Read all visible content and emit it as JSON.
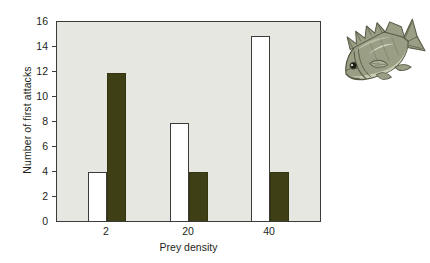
{
  "chart_data": {
    "type": "bar",
    "title": "",
    "xlabel": "Prey density",
    "ylabel": "Number of first attacks",
    "categories": [
      "2",
      "20",
      "40"
    ],
    "ylim": [
      0,
      16
    ],
    "yticks": [
      0,
      2,
      4,
      6,
      8,
      10,
      12,
      14,
      16
    ],
    "ytick_labels": [
      "0",
      "2",
      "4",
      "6",
      "8",
      "10",
      "12",
      "14",
      "16"
    ],
    "grid": false,
    "legend": "none",
    "series": [
      {
        "name": "open",
        "fill": "#ffffff",
        "values": [
          4,
          8,
          15
        ]
      },
      {
        "name": "filled",
        "fill": "#3f3f16",
        "values": [
          12,
          4,
          4
        ]
      }
    ]
  },
  "figure": {
    "plot_background": "#e6e7e0",
    "axis_color": "#3b3b3b",
    "page_background": "#ffffff"
  },
  "illustration": {
    "name": "fish-illustration",
    "subject": "fish",
    "body_color": "#8e9279",
    "belly_color": "#c9cdb6",
    "outline_color": "#5c5f49"
  }
}
